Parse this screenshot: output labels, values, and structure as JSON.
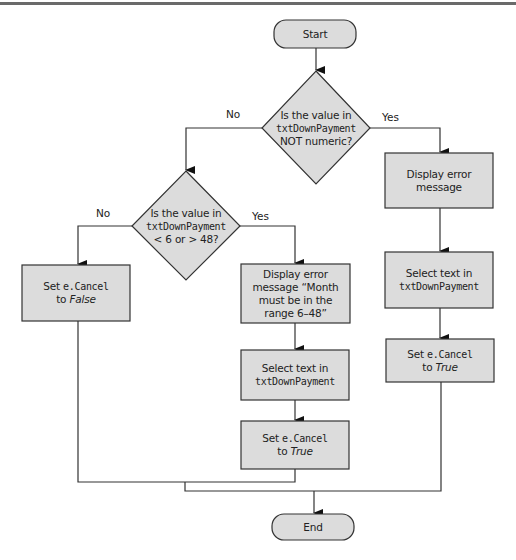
{
  "colors": {
    "node_fill": "#dcdcdc",
    "stroke": "#333333",
    "top_rule": "#6a6a6a"
  },
  "terminals": {
    "start": "Start",
    "end": "End"
  },
  "decisions": [
    {
      "id": "not-numeric",
      "line1": "Is the value in",
      "code": "txtDownPayment",
      "line3": "NOT numeric?",
      "no_label": "No",
      "yes_label": "Yes"
    },
    {
      "id": "out-of-range",
      "line1": "Is the value in",
      "code": "txtDownPayment",
      "line3": "< 6 or > 48?",
      "no_label": "No",
      "yes_label": "Yes"
    }
  ],
  "processes": {
    "set_false": {
      "prefix": "Set ",
      "code": "e.Cancel",
      "to": "to ",
      "value": "False"
    },
    "range_error": {
      "text": "Display error message “Month must be in the range 6–48”"
    },
    "range_select": {
      "text": "Select text in",
      "code": "txtDownPayment"
    },
    "range_set_true": {
      "prefix": "Set ",
      "code": "e.Cancel",
      "to": "to ",
      "value": "True"
    },
    "numeric_error": {
      "text": "Display error message"
    },
    "numeric_select": {
      "text": "Select text in",
      "code": "txtDownPayment"
    },
    "numeric_set_true": {
      "prefix": "Set ",
      "code": "e.Cancel",
      "to": "to ",
      "value": "True"
    }
  }
}
